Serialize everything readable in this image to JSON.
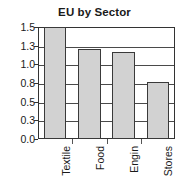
{
  "chart_data": {
    "type": "bar",
    "title": "EU by Sector",
    "xlabel": "",
    "ylabel": "",
    "categories": [
      "Textile",
      "Food",
      "Engin",
      "Stores"
    ],
    "values": [
      1.5,
      1.25,
      1.2,
      0.81
    ],
    "ytick_labels": [
      "1.5",
      "1.3",
      "1.0",
      "0.8",
      "0.5",
      "0.3",
      "0.0"
    ],
    "ytick_values": [
      1.5,
      1.3,
      1.0,
      0.8,
      0.5,
      0.3,
      0.0
    ],
    "ylim": [
      0.0,
      1.5
    ],
    "grid": true,
    "legend": false,
    "bar_fill_color": "#d2d2d2",
    "bar_edge_color": "#3a3a3a",
    "axis_color": "#333333",
    "text_color": "#1a1a1a",
    "label_rotation": -90
  }
}
